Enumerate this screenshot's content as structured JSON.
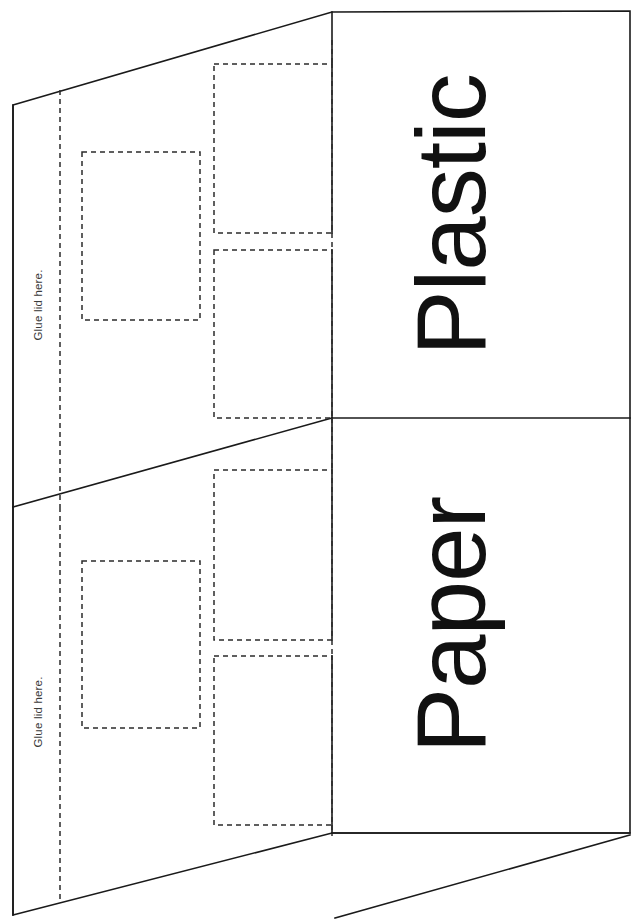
{
  "document": {
    "type": "papercraft-template",
    "title": "Recycling bin net template",
    "background_color": "#ffffff",
    "cut_line_color": "#1a1a1a",
    "fold_line_color": "#2b2b2b",
    "label_color": "#111111",
    "glue_label_color": "#3a3a3a",
    "width": 633,
    "height": 920
  },
  "panels": [
    {
      "id": "plastic",
      "label": "Plastic",
      "rotation_deg": -90,
      "label_x": 485,
      "label_y": 215,
      "glue_tab_label": "Glue lid here.",
      "glue_label_x": 46,
      "glue_label_y": 305
    },
    {
      "id": "paper",
      "label": "Paper",
      "rotation_deg": -90,
      "label_x": 485,
      "label_y": 625,
      "glue_tab_label": "Glue lid here.",
      "glue_label_x": 46,
      "glue_label_y": 712
    }
  ],
  "windows": [
    {
      "name": "plastic-small-window",
      "x": 82,
      "y": 152,
      "w": 118,
      "h": 168
    },
    {
      "name": "plastic-tall-window-upper",
      "x": 214,
      "y": 64,
      "w": 118,
      "h": 169
    },
    {
      "name": "plastic-tall-window-lower",
      "x": 214,
      "y": 250,
      "w": 118,
      "h": 168
    },
    {
      "name": "paper-small-window",
      "x": 82,
      "y": 561,
      "w": 118,
      "h": 167
    },
    {
      "name": "paper-tall-window-upper",
      "x": 214,
      "y": 470,
      "w": 118,
      "h": 170
    },
    {
      "name": "paper-tall-window-lower",
      "x": 214,
      "y": 656,
      "w": 118,
      "h": 169
    }
  ],
  "fold_lines": [
    {
      "name": "glue-tab-fold-upper",
      "x1": 60,
      "y1": 90,
      "x2": 60,
      "y2": 505
    },
    {
      "name": "glue-tab-fold-lower",
      "x1": 60,
      "y1": 505,
      "x2": 60,
      "y2": 905
    },
    {
      "name": "panel-fold-vertical",
      "x1": 332,
      "y1": 12,
      "x2": 332,
      "y2": 833
    }
  ],
  "cut_paths": [
    {
      "name": "outer-outline",
      "d": "M 13 105 L 332 12 L 630 12 L 630 833 L 332 833 L 13 915 Z"
    },
    {
      "name": "mid-slant-plastic",
      "d": "M 13 507 L 332 418"
    },
    {
      "name": "panel-divider",
      "d": "M 332 418 L 630 418"
    }
  ],
  "legend": {
    "solid_line_meaning": "cut line",
    "dashed_line_meaning": "fold / cut-out line"
  }
}
